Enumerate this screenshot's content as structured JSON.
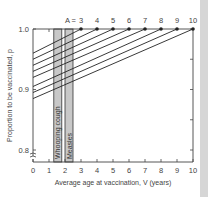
{
  "chart_data": {
    "type": "line",
    "title": "",
    "xlabel": "Average age at vaccination, V (years)",
    "ylabel": "Proportion to be vaccinated, p",
    "xlim": [
      0,
      10
    ],
    "ylim": [
      0.8,
      1.0
    ],
    "x_ticks": [
      "0",
      "1",
      "2",
      "3",
      "4",
      "5",
      "6",
      "7",
      "8",
      "9",
      "10"
    ],
    "y_ticks": [
      "0.8",
      "0.9",
      "1.0"
    ],
    "y_tick_values": [
      0.8,
      0.9,
      1.0
    ],
    "series_label_prefix": "A = ",
    "series": [
      {
        "name": "3",
        "A": 3,
        "points": [
          [
            0,
            0.96
          ],
          [
            3,
            1.0
          ]
        ]
      },
      {
        "name": "4",
        "A": 4,
        "points": [
          [
            0,
            0.95
          ],
          [
            4,
            1.0
          ]
        ]
      },
      {
        "name": "5",
        "A": 5,
        "points": [
          [
            0,
            0.94
          ],
          [
            5,
            1.0
          ]
        ]
      },
      {
        "name": "6",
        "A": 6,
        "points": [
          [
            0,
            0.93
          ],
          [
            6,
            1.0
          ]
        ]
      },
      {
        "name": "7",
        "A": 7,
        "points": [
          [
            0,
            0.92
          ],
          [
            7,
            1.0
          ]
        ]
      },
      {
        "name": "8",
        "A": 8,
        "points": [
          [
            0,
            0.905
          ],
          [
            8,
            1.0
          ]
        ]
      },
      {
        "name": "9",
        "A": 9,
        "points": [
          [
            0,
            0.895
          ],
          [
            9,
            1.0
          ]
        ]
      },
      {
        "name": "10",
        "A": 10,
        "points": [
          [
            0,
            0.885
          ],
          [
            10,
            1.0
          ]
        ]
      }
    ],
    "bands": [
      {
        "label": "Whooping cough",
        "x_range": [
          1.3,
          1.8
        ]
      },
      {
        "label": "Measles",
        "x_range": [
          2.0,
          2.5
        ]
      }
    ],
    "axis_break": true,
    "grid": false,
    "colors": {
      "line": "#222222",
      "band": "#c8c8c8",
      "axis": "#444444"
    }
  }
}
